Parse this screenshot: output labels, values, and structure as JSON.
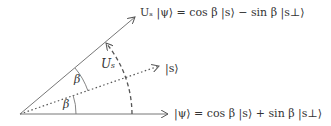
{
  "diagram": {
    "type": "vector rotation diagram",
    "labels": {
      "top_vector": "Uₛ |ψ⟩ = cos β |s⟩ − sin β |s⊥⟩",
      "middle_vector": "|s⟩",
      "bottom_vector": "|ψ⟩ = cos β |s⟩ + sin β |s⊥⟩",
      "rotation_op": "Uₛ",
      "angle_upper": "β",
      "angle_lower": "β"
    },
    "colors": {
      "line": "#666666",
      "text": "#333333"
    }
  }
}
